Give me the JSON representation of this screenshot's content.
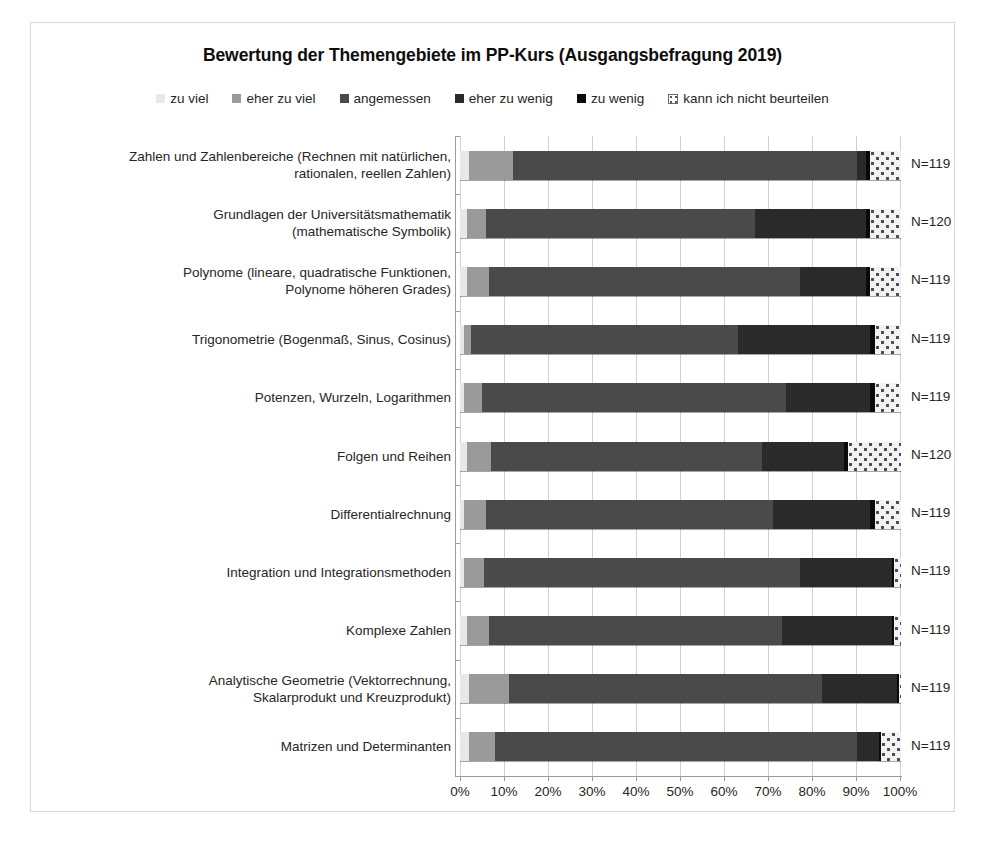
{
  "chart_data": {
    "type": "bar",
    "subtype": "stacked-horizontal-100-percent",
    "title": "Bewertung der Themengebiete im PP-Kurs (Ausgangsbefragung 2019)",
    "xlabel": "",
    "ylabel": "",
    "xlim": [
      0,
      100
    ],
    "grid": true,
    "legend_position": "top",
    "xticks": [
      "0%",
      "10%",
      "20%",
      "30%",
      "40%",
      "50%",
      "60%",
      "70%",
      "80%",
      "90%",
      "100%"
    ],
    "xtick_values": [
      0,
      10,
      20,
      30,
      40,
      50,
      60,
      70,
      80,
      90,
      100
    ],
    "legend": [
      {
        "label": "zu viel",
        "color": "#e8e8e8",
        "pattern": "solid"
      },
      {
        "label": "eher zu viel",
        "color": "#9a9a9a",
        "pattern": "solid"
      },
      {
        "label": "angemessen",
        "color": "#4a4a4a",
        "pattern": "solid"
      },
      {
        "label": "eher zu wenig",
        "color": "#2a2a2a",
        "pattern": "solid"
      },
      {
        "label": "zu wenig",
        "color": "#0a0a0a",
        "pattern": "solid"
      },
      {
        "label": "kann ich nicht beurteilen",
        "color": "#f2f2f2",
        "pattern": "dotted-hatch"
      }
    ],
    "categories": [
      "Zahlen und Zahlenbereiche (Rechnen mit natürlichen, rationalen, reellen Zahlen)",
      "Grundlagen der Universitätsmathematik (mathematische Symbolik)",
      "Polynome (lineare, quadratische Funktionen, Polynome höheren Grades)",
      "Trigonometrie (Bogenmaß, Sinus, Cosinus)",
      "Potenzen, Wurzeln, Logarithmen",
      "Folgen und Reihen",
      "Differentialrechnung",
      "Integration und Integrationsmethoden",
      "Komplexe Zahlen",
      "Analytische Geometrie (Vektorrechnung, Skalarprodukt und Kreuzprodukt)",
      "Matrizen und Determinanten"
    ],
    "category_lines": [
      [
        "Zahlen und Zahlenbereiche (Rechnen mit natürlichen,",
        "rationalen, reellen Zahlen)"
      ],
      [
        "Grundlagen der Universitätsmathematik",
        "(mathematische Symbolik)"
      ],
      [
        "Polynome (lineare, quadratische Funktionen,",
        "Polynome höheren Grades)"
      ],
      [
        "Trigonometrie (Bogenmaß, Sinus, Cosinus)"
      ],
      [
        "Potenzen, Wurzeln, Logarithmen"
      ],
      [
        "Folgen und Reihen"
      ],
      [
        "Differentialrechnung"
      ],
      [
        "Integration und Integrationsmethoden"
      ],
      [
        "Komplexe Zahlen"
      ],
      [
        "Analytische Geometrie (Vektorrechnung,",
        "Skalarprodukt und Kreuzprodukt)"
      ],
      [
        "Matrizen und Determinanten"
      ]
    ],
    "series": [
      {
        "name": "zu viel",
        "values": [
          2.0,
          1.5,
          1.5,
          1.0,
          1.0,
          1.5,
          1.0,
          0.8,
          1.5,
          2.0,
          2.0
        ]
      },
      {
        "name": "eher zu viel",
        "values": [
          10.0,
          4.5,
          5.0,
          1.5,
          4.0,
          5.5,
          5.0,
          4.7,
          5.0,
          9.0,
          6.0
        ]
      },
      {
        "name": "angemessen",
        "values": [
          78.0,
          61.0,
          70.5,
          60.5,
          69.0,
          61.5,
          65.0,
          71.5,
          66.5,
          71.0,
          82.0
        ]
      },
      {
        "name": "eher zu wenig",
        "values": [
          2.0,
          25.0,
          15.0,
          30.0,
          19.0,
          18.5,
          22.0,
          21.0,
          25.0,
          17.0,
          5.0
        ]
      },
      {
        "name": "zu wenig",
        "values": [
          1.0,
          1.0,
          1.0,
          1.0,
          1.0,
          1.0,
          1.0,
          0.5,
          0.5,
          0.5,
          0.5
        ]
      },
      {
        "name": "kann ich nicht beurteilen",
        "values": [
          7.0,
          7.0,
          7.0,
          6.0,
          6.0,
          12.0,
          6.0,
          1.5,
          1.5,
          0.5,
          4.5
        ]
      }
    ],
    "n_labels": [
      "N=119",
      "N=120",
      "N=119",
      "N=119",
      "N=119",
      "N=120",
      "N=119",
      "N=119",
      "N=119",
      "N=119",
      "N=119"
    ]
  }
}
